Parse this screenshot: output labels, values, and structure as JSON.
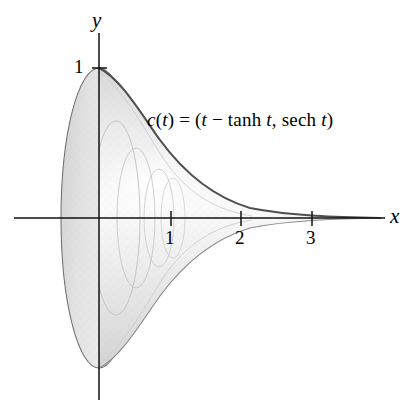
{
  "figure": {
    "kind": "parametric-surface-of-revolution",
    "background_color": "#ffffff",
    "ink_color": "#1a1a1a",
    "fill_color": "#e3e3e3",
    "fill_color_light": "#f2f2f2",
    "rib_color": "#b9b9b9",
    "outline_color": "#555555",
    "profile_color": "#4a4a4a"
  },
  "equation": {
    "full_text": "c(t) = (t − tanh t, sech t)",
    "parts": {
      "fn_name": "c",
      "open_paren": "(",
      "param": "t",
      "close_paren": ")",
      "equals": "=",
      "tuple_open": "(",
      "x_component": "t − tanh t",
      "comma": ",",
      "y_component": "sech t",
      "tuple_close": ")"
    },
    "pieces": [
      {
        "t": "c",
        "style": "italic"
      },
      {
        "t": "(",
        "style": "upright"
      },
      {
        "t": "t",
        "style": "italic"
      },
      {
        "t": ")",
        "style": "upright"
      },
      {
        "t": " = (",
        "style": "upright"
      },
      {
        "t": "t",
        "style": "italic"
      },
      {
        "t": " − ",
        "style": "upright"
      },
      {
        "t": "tanh",
        "style": "upright"
      },
      {
        "t": " t",
        "style": "italic"
      },
      {
        "t": ", ",
        "style": "upright"
      },
      {
        "t": "sech",
        "style": "upright"
      },
      {
        "t": " t",
        "style": "italic"
      },
      {
        "t": ")",
        "style": "upright"
      }
    ]
  },
  "axes": {
    "x_axis": {
      "label": "x",
      "label_style": "italic",
      "ticks": [
        {
          "value": 1,
          "label": "1"
        },
        {
          "value": 2,
          "label": "2"
        },
        {
          "value": 3,
          "label": "3"
        }
      ],
      "range_units": [
        -1.2,
        4.1
      ]
    },
    "y_axis": {
      "label": "y",
      "label_style": "italic",
      "ticks": [
        {
          "value": 1,
          "label": "1"
        }
      ],
      "range_units": [
        -1.25,
        1.25
      ]
    },
    "origin_px": {
      "x": 99,
      "y": 218
    },
    "scale_px_per_unit": {
      "x": 71,
      "y": 150
    }
  },
  "chart_data": {
    "type": "line",
    "title": "",
    "xlabel": "x",
    "ylabel": "y",
    "xlim": [
      -1.2,
      4.1
    ],
    "ylim": [
      -1.25,
      1.25
    ],
    "grid": false,
    "legend": "none",
    "annotations": [
      {
        "text": "c(t) = (t − tanh t, sech t)",
        "x_units": 0.7,
        "y_units": 0.62
      }
    ],
    "series": [
      {
        "name": "tractrix profile (upper)",
        "parametric": "x = t - tanh t,  y = sech t",
        "t": [
          0.0,
          0.2,
          0.4,
          0.6,
          0.8,
          1.0,
          1.2,
          1.4,
          1.6,
          1.8,
          2.0,
          2.4,
          2.8,
          3.2,
          3.6,
          4.0,
          4.5
        ],
        "x": [
          0.0,
          0.003,
          0.02,
          0.063,
          0.136,
          0.238,
          0.367,
          0.515,
          0.678,
          0.853,
          1.036,
          1.416,
          1.807,
          2.203,
          2.601,
          3.0,
          3.5
        ],
        "y": [
          1.0,
          0.98,
          0.925,
          0.844,
          0.748,
          0.648,
          0.552,
          0.465,
          0.389,
          0.323,
          0.266,
          0.18,
          0.121,
          0.081,
          0.054,
          0.037,
          0.022
        ]
      },
      {
        "name": "tractrix profile (lower, mirrored)",
        "parametric": "x = t - tanh t,  y = -sech t",
        "t": [
          0.0,
          0.2,
          0.4,
          0.6,
          0.8,
          1.0,
          1.2,
          1.4,
          1.6,
          1.8,
          2.0,
          2.4,
          2.8,
          3.2,
          3.6,
          4.0,
          4.5
        ],
        "x": [
          0.0,
          0.003,
          0.02,
          0.063,
          0.136,
          0.238,
          0.367,
          0.515,
          0.678,
          0.853,
          1.036,
          1.416,
          1.807,
          2.203,
          2.601,
          3.0,
          3.5
        ],
        "y": [
          -1.0,
          -0.98,
          -0.925,
          -0.844,
          -0.748,
          -0.648,
          -0.552,
          -0.465,
          -0.389,
          -0.323,
          -0.266,
          -0.18,
          -0.121,
          -0.081,
          -0.054,
          -0.037,
          -0.022
        ]
      }
    ],
    "cross_sections": [
      {
        "name": "rim-circle",
        "x_units": 0.0,
        "radius_units": 1.0
      },
      {
        "name": "rib-1",
        "x_units": 0.24,
        "radius_units": 0.65
      },
      {
        "name": "rib-2",
        "x_units": 0.52,
        "radius_units": 0.465
      },
      {
        "name": "rib-3",
        "x_units": 0.85,
        "radius_units": 0.323
      },
      {
        "name": "rib-4",
        "x_units": 1.04,
        "radius_units": 0.266
      }
    ]
  }
}
